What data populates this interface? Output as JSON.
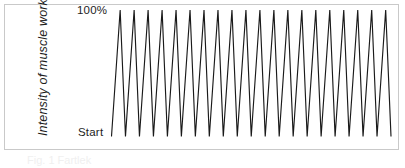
{
  "figure": {
    "caption": "Fig. 1 Fartlek",
    "frame_color": "#c9c9c9",
    "background": "#ffffff",
    "line_color": "#1a1a1a"
  },
  "axes": {
    "y_title": "Intensity of muscle work",
    "y_top_label": "100%",
    "y_base_label": "Start"
  },
  "chart_data": {
    "type": "line",
    "title": "",
    "xlabel": "",
    "ylabel": "Intensity of muscle work",
    "grid": false,
    "legend": null,
    "ylim": [
      0,
      100
    ],
    "ytick_labels": [
      "Start",
      "100%"
    ],
    "ytick_values": [
      0,
      100
    ],
    "xlim": [
      0,
      20
    ],
    "peak_count": 20,
    "series": [
      {
        "name": "Intensity of muscle work",
        "x": [
          0,
          0.62,
          1,
          1.62,
          2,
          2.62,
          3,
          3.62,
          4,
          4.62,
          5,
          5.62,
          6,
          6.62,
          7,
          7.62,
          8,
          8.62,
          9,
          9.62,
          10,
          10.62,
          11,
          11.62,
          12,
          12.62,
          13,
          13.62,
          14,
          14.62,
          15,
          15.62,
          16,
          16.62,
          17,
          17.62,
          18,
          18.62,
          19,
          19.62,
          20
        ],
        "values": [
          0,
          100,
          0,
          100,
          0,
          100,
          0,
          100,
          0,
          100,
          0,
          100,
          0,
          100,
          0,
          100,
          0,
          100,
          0,
          100,
          0,
          100,
          0,
          100,
          0,
          100,
          0,
          100,
          0,
          100,
          0,
          100,
          0,
          100,
          0,
          100,
          0,
          100,
          0,
          100,
          0
        ]
      }
    ]
  }
}
